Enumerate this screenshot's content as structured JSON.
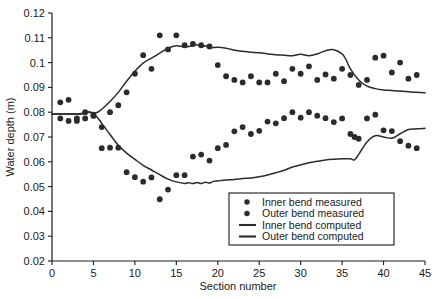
{
  "chart_data": {
    "type": "scatter",
    "title": "",
    "xlabel": "Section number",
    "ylabel": "Water depth (m)",
    "xlim": [
      0,
      45
    ],
    "ylim": [
      0.02,
      0.12
    ],
    "xticks": [
      0,
      5,
      10,
      15,
      20,
      25,
      30,
      35,
      40,
      45
    ],
    "xtick_labels": [
      "0",
      "5",
      "10",
      "15",
      "20",
      "25",
      "30",
      "35",
      "40",
      "45"
    ],
    "yticks": [
      0.02,
      0.03,
      0.04,
      0.05,
      0.06,
      0.07,
      0.08,
      0.09,
      0.1,
      0.11,
      0.12
    ],
    "ytick_labels": [
      "0.02",
      "0.03",
      "0.04",
      "0.05",
      "0.06",
      "0.07",
      "0.08",
      "0.09",
      "0.1",
      "0.11",
      "0.12"
    ],
    "grid": false,
    "legend_position": "lower right",
    "marker_color": "#2b2b2b",
    "line_color": "#2b2b2b",
    "series": [
      {
        "name": "Inner bend measured",
        "type": "scatter",
        "x": [
          1,
          2,
          3,
          4,
          5,
          6,
          7,
          8,
          9,
          10,
          11,
          12,
          13,
          14,
          15,
          16,
          17,
          18,
          19,
          20,
          21,
          22,
          23,
          24,
          25,
          26,
          27,
          28,
          29,
          30,
          31,
          32,
          33,
          34,
          35,
          36,
          36.5,
          37,
          38,
          39,
          40,
          41,
          42,
          43,
          44
        ],
        "y": [
          0.0775,
          0.0765,
          0.0765,
          0.0775,
          0.0785,
          0.0655,
          0.0657,
          0.0657,
          0.0558,
          0.0538,
          0.052,
          0.0537,
          0.0449,
          0.0488,
          0.0546,
          0.0546,
          0.0621,
          0.0629,
          0.0605,
          0.0655,
          0.0668,
          0.0723,
          0.074,
          0.0712,
          0.0725,
          0.0762,
          0.0755,
          0.0776,
          0.08,
          0.0778,
          0.08,
          0.0786,
          0.0776,
          0.076,
          0.0775,
          0.0712,
          0.07,
          0.0693,
          0.0775,
          0.079,
          0.0727,
          0.0724,
          0.0683,
          0.0665,
          0.0655
        ]
      },
      {
        "name": "Outer bend measured",
        "type": "scatter",
        "x": [
          1,
          2,
          3,
          4,
          5,
          6,
          7,
          8,
          9,
          10,
          11,
          12,
          13,
          14,
          15,
          16,
          17,
          18,
          19,
          20,
          21,
          22,
          23,
          24,
          25,
          26,
          27,
          28,
          29,
          30,
          31,
          32,
          33,
          34,
          35,
          36,
          37,
          38,
          39,
          40,
          41,
          42,
          43,
          44
        ],
        "y": [
          0.084,
          0.085,
          0.0775,
          0.08,
          0.079,
          0.074,
          0.08,
          0.0828,
          0.088,
          0.0955,
          0.103,
          0.0975,
          0.111,
          0.1053,
          0.111,
          0.107,
          0.1075,
          0.107,
          0.1065,
          0.099,
          0.0945,
          0.093,
          0.092,
          0.0945,
          0.092,
          0.092,
          0.0955,
          0.0925,
          0.0975,
          0.0955,
          0.0985,
          0.093,
          0.0952,
          0.0935,
          0.0975,
          0.095,
          0.091,
          0.093,
          0.102,
          0.1028,
          0.096,
          0.1,
          0.0935,
          0.095
        ]
      },
      {
        "name": "Inner bend computed",
        "type": "line",
        "x": [
          0,
          1,
          2,
          3,
          4,
          4.5,
          5,
          5.5,
          6,
          7,
          8,
          9,
          10,
          11,
          12,
          13,
          14,
          15,
          16,
          16.5,
          17,
          17.5,
          18,
          18.5,
          19,
          19.5,
          20,
          21,
          22,
          23,
          24,
          25,
          26,
          27,
          28,
          29,
          30,
          31,
          32,
          33,
          34,
          35,
          36,
          36.5,
          37,
          38,
          39,
          40,
          41,
          42,
          43,
          44,
          45
        ],
        "y": [
          0.0793,
          0.0793,
          0.0793,
          0.0793,
          0.0795,
          0.08,
          0.0793,
          0.0778,
          0.0755,
          0.071,
          0.0667,
          0.0635,
          0.061,
          0.0586,
          0.0567,
          0.0548,
          0.053,
          0.0519,
          0.0513,
          0.0516,
          0.0512,
          0.0517,
          0.0512,
          0.0518,
          0.0514,
          0.0521,
          0.0523,
          0.0527,
          0.0529,
          0.0533,
          0.0535,
          0.054,
          0.0547,
          0.0556,
          0.0566,
          0.0579,
          0.0587,
          0.0596,
          0.0602,
          0.0607,
          0.061,
          0.0612,
          0.0612,
          0.0608,
          0.063,
          0.068,
          0.0705,
          0.07,
          0.0695,
          0.0713,
          0.073,
          0.0733,
          0.0735
        ]
      },
      {
        "name": "Outer bend computed",
        "type": "line",
        "x": [
          0,
          1,
          2,
          3,
          4,
          4.5,
          5,
          5.5,
          6,
          7,
          8,
          9,
          10,
          11,
          12,
          13,
          14,
          15,
          16,
          17,
          17.5,
          18,
          18.5,
          19,
          20,
          21,
          22,
          23,
          24,
          25,
          26,
          27,
          28,
          29,
          30,
          31,
          32,
          33,
          34,
          35,
          35.5,
          36,
          37,
          38,
          39,
          40,
          41,
          42,
          43,
          44,
          45
        ],
        "y": [
          0.0793,
          0.0793,
          0.0793,
          0.0793,
          0.0797,
          0.0802,
          0.0797,
          0.08,
          0.0812,
          0.0843,
          0.088,
          0.0925,
          0.0965,
          0.0998,
          0.1018,
          0.1038,
          0.1058,
          0.1068,
          0.1063,
          0.1068,
          0.1072,
          0.1063,
          0.1068,
          0.106,
          0.1062,
          0.1058,
          0.105,
          0.1046,
          0.1042,
          0.104,
          0.1035,
          0.1032,
          0.103,
          0.1028,
          0.1034,
          0.1028,
          0.1035,
          0.1048,
          0.1052,
          0.1035,
          0.101,
          0.0975,
          0.093,
          0.0905,
          0.0895,
          0.089,
          0.0888,
          0.0885,
          0.0882,
          0.088,
          0.0878
        ]
      }
    ],
    "legend": [
      {
        "label": "Inner bend measured",
        "marker": "circle"
      },
      {
        "label": "Outer bend measured",
        "marker": "circle"
      },
      {
        "label": "Inner bend computed",
        "marker": "line"
      },
      {
        "label": "Outer bend computed",
        "marker": "line"
      }
    ]
  }
}
